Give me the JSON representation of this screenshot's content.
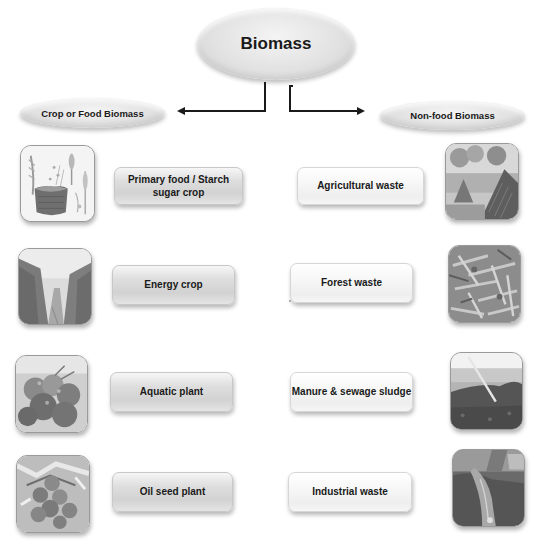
{
  "diagram": {
    "root": {
      "label": "Biomass"
    },
    "categories": {
      "left": {
        "label": "Crop or Food Biomass"
      },
      "right": {
        "label": "Non-food Biomass"
      }
    },
    "left_items": [
      {
        "label": "Primary food / Starch sugar crop",
        "icon": "grain-sack-photo"
      },
      {
        "label": "Energy crop",
        "icon": "tree-plantation-photo"
      },
      {
        "label": "Aquatic plant",
        "icon": "aquatic-plant-photo"
      },
      {
        "label": "Oil seed plant",
        "icon": "oil-seed-fruit-photo"
      }
    ],
    "right_items": [
      {
        "label": "Agricultural waste",
        "icon": "hay-stack-photo"
      },
      {
        "label": "Forest waste",
        "icon": "wood-debris-photo"
      },
      {
        "label": "Manure & sewage sludge",
        "icon": "manure-pile-photo"
      },
      {
        "label": "Industrial waste",
        "icon": "industrial-discharge-photo"
      }
    ],
    "colors": {
      "text": "#1a1a1a",
      "connector": "#1a1a1a",
      "ellipse_fill": "#e2e2e2",
      "left_box_fill": "#d8d8d8",
      "right_box_fill": "#f4f4f4"
    }
  }
}
